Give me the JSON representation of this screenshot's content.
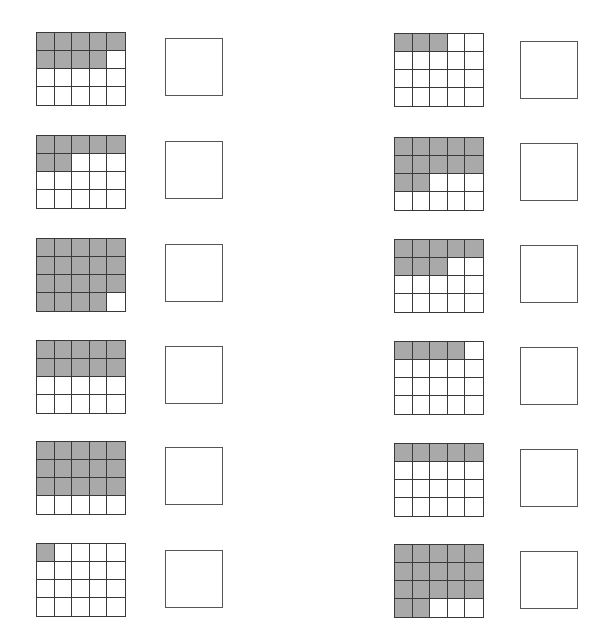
{
  "worksheet": {
    "grid_rows": 4,
    "grid_cols": 5,
    "shade_color": "#a9a9a9",
    "line_color": "#3a3a3a",
    "problems": [
      {
        "column": "left",
        "grid": {
          "x": 36,
          "y": 32
        },
        "box": {
          "x": 165,
          "y": 38
        },
        "shaded_cells": 9,
        "answer": ""
      },
      {
        "column": "left",
        "grid": {
          "x": 36,
          "y": 135
        },
        "box": {
          "x": 165,
          "y": 141
        },
        "shaded_cells": 7,
        "answer": ""
      },
      {
        "column": "left",
        "grid": {
          "x": 36,
          "y": 238
        },
        "box": {
          "x": 165,
          "y": 244
        },
        "shaded_cells": 19,
        "answer": ""
      },
      {
        "column": "left",
        "grid": {
          "x": 36,
          "y": 340
        },
        "box": {
          "x": 165,
          "y": 346
        },
        "shaded_cells": 10,
        "answer": ""
      },
      {
        "column": "left",
        "grid": {
          "x": 36,
          "y": 441
        },
        "box": {
          "x": 165,
          "y": 447
        },
        "shaded_cells": 15,
        "answer": ""
      },
      {
        "column": "left",
        "grid": {
          "x": 36,
          "y": 543
        },
        "box": {
          "x": 165,
          "y": 550
        },
        "shaded_cells": 1,
        "answer": ""
      },
      {
        "column": "right",
        "grid": {
          "x": 394,
          "y": 33
        },
        "box": {
          "x": 520,
          "y": 41
        },
        "shaded_cells": 3,
        "answer": ""
      },
      {
        "column": "right",
        "grid": {
          "x": 394,
          "y": 137
        },
        "box": {
          "x": 520,
          "y": 143
        },
        "shaded_cells": 12,
        "answer": ""
      },
      {
        "column": "right",
        "grid": {
          "x": 394,
          "y": 239
        },
        "box": {
          "x": 520,
          "y": 245
        },
        "shaded_cells": 8,
        "answer": ""
      },
      {
        "column": "right",
        "grid": {
          "x": 394,
          "y": 341
        },
        "box": {
          "x": 520,
          "y": 347
        },
        "shaded_cells": 4,
        "answer": ""
      },
      {
        "column": "right",
        "grid": {
          "x": 394,
          "y": 443
        },
        "box": {
          "x": 520,
          "y": 449
        },
        "shaded_cells": 5,
        "answer": ""
      },
      {
        "column": "right",
        "grid": {
          "x": 394,
          "y": 544
        },
        "box": {
          "x": 520,
          "y": 551
        },
        "shaded_cells": 17,
        "answer": ""
      }
    ]
  }
}
